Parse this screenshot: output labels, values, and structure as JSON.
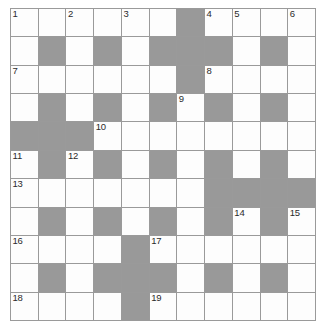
{
  "puzzle": {
    "type": "crossword-grid",
    "rows": 11,
    "cols": 11,
    "colors": {
      "block": "#999999",
      "cell": "#fdfdfd",
      "grid_line": "#9a9a9a",
      "number": "#2b2b2b",
      "background": "#ffffff"
    },
    "blocks": [
      [
        0,
        0,
        0,
        0,
        0,
        0,
        1,
        0,
        0,
        0,
        0
      ],
      [
        0,
        1,
        0,
        1,
        0,
        1,
        1,
        1,
        0,
        1,
        0
      ],
      [
        0,
        0,
        0,
        0,
        0,
        0,
        1,
        0,
        0,
        0,
        0
      ],
      [
        0,
        1,
        0,
        1,
        0,
        1,
        0,
        1,
        0,
        1,
        0
      ],
      [
        1,
        1,
        1,
        0,
        0,
        0,
        0,
        0,
        0,
        0,
        0
      ],
      [
        0,
        1,
        0,
        1,
        0,
        1,
        0,
        1,
        0,
        1,
        0
      ],
      [
        0,
        0,
        0,
        0,
        0,
        0,
        0,
        1,
        1,
        1,
        1
      ],
      [
        0,
        1,
        0,
        1,
        0,
        1,
        0,
        1,
        0,
        1,
        0
      ],
      [
        0,
        0,
        0,
        0,
        1,
        0,
        0,
        0,
        0,
        0,
        0
      ],
      [
        0,
        1,
        0,
        1,
        1,
        1,
        0,
        1,
        0,
        1,
        0
      ],
      [
        0,
        0,
        0,
        0,
        1,
        0,
        0,
        0,
        0,
        0,
        0
      ]
    ],
    "numbers": [
      {
        "row": 0,
        "col": 0,
        "label": "1"
      },
      {
        "row": 0,
        "col": 2,
        "label": "2"
      },
      {
        "row": 0,
        "col": 4,
        "label": "3"
      },
      {
        "row": 0,
        "col": 7,
        "label": "4"
      },
      {
        "row": 0,
        "col": 8,
        "label": "5"
      },
      {
        "row": 0,
        "col": 10,
        "label": "6"
      },
      {
        "row": 2,
        "col": 0,
        "label": "7"
      },
      {
        "row": 2,
        "col": 7,
        "label": "8"
      },
      {
        "row": 3,
        "col": 6,
        "label": "9"
      },
      {
        "row": 4,
        "col": 3,
        "label": "10"
      },
      {
        "row": 5,
        "col": 0,
        "label": "11"
      },
      {
        "row": 5,
        "col": 2,
        "label": "12"
      },
      {
        "row": 6,
        "col": 0,
        "label": "13"
      },
      {
        "row": 7,
        "col": 8,
        "label": "14"
      },
      {
        "row": 7,
        "col": 10,
        "label": "15"
      },
      {
        "row": 8,
        "col": 0,
        "label": "16"
      },
      {
        "row": 8,
        "col": 5,
        "label": "17"
      },
      {
        "row": 10,
        "col": 0,
        "label": "18"
      },
      {
        "row": 10,
        "col": 5,
        "label": "19"
      }
    ]
  }
}
